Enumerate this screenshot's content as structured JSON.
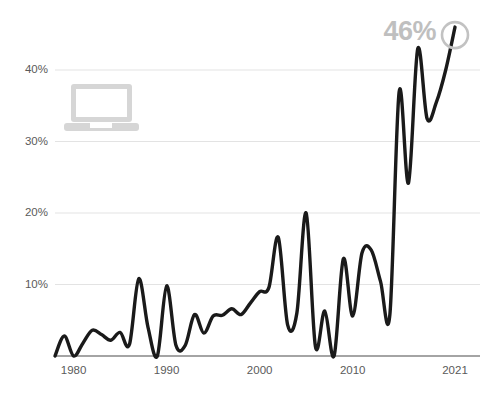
{
  "chart_data": {
    "type": "line",
    "title": "",
    "subtitle": "",
    "xlabel": "",
    "ylabel": "",
    "xlim": [
      1978,
      2021
    ],
    "ylim": [
      0,
      46
    ],
    "grid": true,
    "legend_position": "none",
    "x_tick_labels": [
      "1980",
      "1990",
      "2000",
      "2010",
      "2021"
    ],
    "x_tick_values": [
      1980,
      1990,
      2000,
      2010,
      2021
    ],
    "y_tick_labels": [
      "10%",
      "20%",
      "30%",
      "40%"
    ],
    "y_tick_values": [
      10,
      20,
      30,
      40
    ],
    "annotations": [
      {
        "text": "46%",
        "x": 2021,
        "y": 46,
        "color": "#bfbfbf"
      }
    ],
    "series": [
      {
        "name": "value",
        "color": "#1a1a1a",
        "x": [
          1978,
          1979,
          1980,
          1981,
          1982,
          1983,
          1984,
          1985,
          1986,
          1987,
          1988,
          1989,
          1990,
          1991,
          1992,
          1993,
          1994,
          1995,
          1996,
          1997,
          1998,
          1999,
          2000,
          2001,
          2002,
          2003,
          2004,
          2005,
          2006,
          2007,
          2008,
          2009,
          2010,
          2011,
          2012,
          2013,
          2014,
          2015,
          2016,
          2017,
          2018,
          2019,
          2020,
          2021
        ],
        "values": [
          0.0,
          2.8,
          0.0,
          1.8,
          3.6,
          3.0,
          2.2,
          3.3,
          1.6,
          10.8,
          4.0,
          0.0,
          9.8,
          1.5,
          1.5,
          5.8,
          3.2,
          5.6,
          5.7,
          6.6,
          5.8,
          7.4,
          9.0,
          9.6,
          16.6,
          4.4,
          6.0,
          20.0,
          1.3,
          6.3,
          0.0,
          13.6,
          5.6,
          14.4,
          14.8,
          10.4,
          5.8,
          37.0,
          24.2,
          43.0,
          33.2,
          35.5,
          40.0,
          46.0
        ]
      }
    ]
  },
  "icons": {
    "laptop": "laptop-icon",
    "end_marker": "circle-marker"
  },
  "callout": {
    "value": "46%"
  }
}
